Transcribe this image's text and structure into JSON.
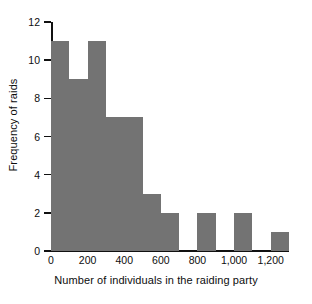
{
  "chart_data": {
    "type": "bar",
    "title": "",
    "subtitle": "",
    "xlabel": "Number of individuals in the raiding party",
    "ylabel": "Frequency of raids",
    "xlim": [
      0,
      1300
    ],
    "ylim": [
      0,
      12
    ],
    "grid": false,
    "legend": null,
    "bin_width": 100,
    "bar_color": "#737373",
    "axis_color": "#111111",
    "background_color": "#ffffff",
    "xticks": [
      {
        "value": 0,
        "label": "0"
      },
      {
        "value": 200,
        "label": "200"
      },
      {
        "value": 400,
        "label": "400"
      },
      {
        "value": 600,
        "label": "600"
      },
      {
        "value": 800,
        "label": "800"
      },
      {
        "value": 1000,
        "label": "1,000"
      },
      {
        "value": 1200,
        "label": "1,200"
      }
    ],
    "yticks": [
      {
        "value": 0,
        "label": "0"
      },
      {
        "value": 2,
        "label": "2"
      },
      {
        "value": 4,
        "label": "4"
      },
      {
        "value": 6,
        "label": "6"
      },
      {
        "value": 8,
        "label": "8"
      },
      {
        "value": 10,
        "label": "10"
      },
      {
        "value": 12,
        "label": "12"
      }
    ],
    "bins": [
      {
        "x0": 0,
        "x1": 100,
        "label": "0-100",
        "value": 11
      },
      {
        "x0": 100,
        "x1": 200,
        "label": "100-200",
        "value": 9
      },
      {
        "x0": 200,
        "x1": 300,
        "label": "200-300",
        "value": 11
      },
      {
        "x0": 300,
        "x1": 400,
        "label": "300-400",
        "value": 7
      },
      {
        "x0": 400,
        "x1": 500,
        "label": "400-500",
        "value": 7
      },
      {
        "x0": 500,
        "x1": 600,
        "label": "500-600",
        "value": 3
      },
      {
        "x0": 600,
        "x1": 700,
        "label": "600-700",
        "value": 2
      },
      {
        "x0": 700,
        "x1": 800,
        "label": "700-800",
        "value": 0
      },
      {
        "x0": 800,
        "x1": 900,
        "label": "800-900",
        "value": 2
      },
      {
        "x0": 900,
        "x1": 1000,
        "label": "900-1000",
        "value": 0
      },
      {
        "x0": 1000,
        "x1": 1100,
        "label": "1000-1100",
        "value": 2
      },
      {
        "x0": 1100,
        "x1": 1200,
        "label": "1100-1200",
        "value": 0
      },
      {
        "x0": 1200,
        "x1": 1300,
        "label": "1200-1300",
        "value": 1
      }
    ],
    "categories": [
      "0-100",
      "100-200",
      "200-300",
      "300-400",
      "400-500",
      "500-600",
      "600-700",
      "700-800",
      "800-900",
      "900-1000",
      "1000-1100",
      "1100-1200",
      "1200-1300"
    ],
    "values": [
      11,
      9,
      11,
      7,
      7,
      3,
      2,
      0,
      2,
      0,
      2,
      0,
      1
    ]
  }
}
